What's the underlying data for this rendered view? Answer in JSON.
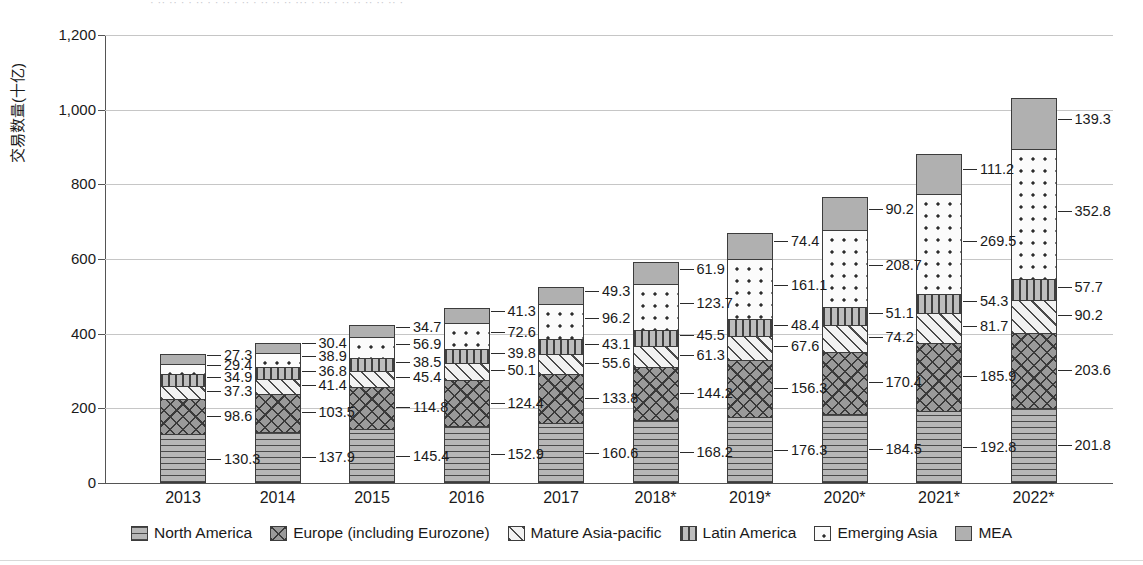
{
  "top_clipped_text": "· ·· ·· · · ·· · · ·· · ·· · ·· ·· ·· ··· · ··· · ·· ·· ·· ·· ·· ·",
  "axis": {
    "ylabel": "交易数量(十亿)",
    "ytick_labels": [
      "1,200",
      "1,000",
      "800",
      "600",
      "400",
      "200",
      "0"
    ],
    "ytick_values": [
      1200,
      1000,
      800,
      600,
      400,
      200,
      0
    ]
  },
  "legend": {
    "items": [
      {
        "label": "North America",
        "pattern": "horizontal-lines",
        "color": "#b7b7b7",
        "swatch_class": "p-na"
      },
      {
        "label": "Europe (including Eurozone)",
        "pattern": "cross-hatch",
        "color": "#9a9a9a",
        "swatch_class": "p-eu"
      },
      {
        "label": "Mature Asia-pacific",
        "pattern": "diagonal-lines",
        "color": "#f2f2f2",
        "swatch_class": "p-ma"
      },
      {
        "label": "Latin America",
        "pattern": "vertical-lines",
        "color": "#bdbdbd",
        "swatch_class": "p-la"
      },
      {
        "label": "Emerging Asia",
        "pattern": "dots",
        "color": "#fbfbfb",
        "swatch_class": "p-ea"
      },
      {
        "label": "MEA",
        "pattern": "solid",
        "color": "#b0b0b0",
        "swatch_class": "p-mea"
      }
    ]
  },
  "chart_data": {
    "type": "bar",
    "stacked": true,
    "title": "",
    "xlabel": "",
    "ylabel": "交易数量(十亿)",
    "ylim": [
      0,
      1200
    ],
    "ytick_step": 200,
    "grid": true,
    "legend_position": "bottom",
    "categories": [
      "2013",
      "2014",
      "2015",
      "2016",
      "2017",
      "2018*",
      "2019*",
      "2020*",
      "2021*",
      "2022*"
    ],
    "series": [
      {
        "name": "North America",
        "values": [
          130.3,
          137.9,
          145.4,
          152.9,
          160.6,
          168.2,
          176.3,
          184.5,
          192.8,
          201.8
        ]
      },
      {
        "name": "Europe (including Eurozone)",
        "values": [
          98.6,
          103.5,
          114.8,
          124.4,
          133.8,
          144.2,
          156.3,
          170.4,
          185.9,
          203.6
        ]
      },
      {
        "name": "Mature Asia-pacific",
        "values": [
          37.3,
          41.4,
          45.4,
          50.1,
          55.6,
          61.3,
          67.6,
          74.2,
          81.7,
          90.2
        ]
      },
      {
        "name": "Latin America",
        "values": [
          34.9,
          36.8,
          38.5,
          39.8,
          43.1,
          45.5,
          48.4,
          51.1,
          54.3,
          57.7
        ]
      },
      {
        "name": "Emerging Asia",
        "values": [
          29.4,
          38.9,
          56.9,
          72.6,
          96.2,
          123.7,
          161.1,
          208.7,
          269.5,
          352.8
        ]
      },
      {
        "name": "MEA",
        "values": [
          27.3,
          30.4,
          34.7,
          41.3,
          49.3,
          61.9,
          74.4,
          90.2,
          111.2,
          139.3
        ]
      }
    ],
    "totals": [
      357.8,
      388.9,
      435.7,
      481.1,
      538.6,
      604.8,
      684.1,
      779.1,
      895.4,
      1045.4
    ]
  }
}
